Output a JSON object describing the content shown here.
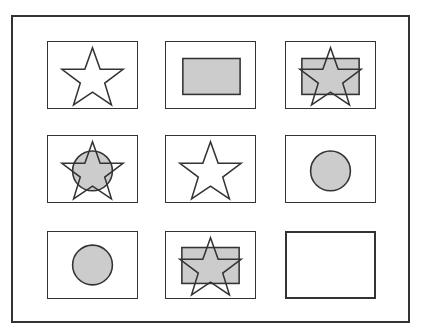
{
  "puzzle": {
    "type": "3x3 matrix reasoning",
    "colors": {
      "stroke": "#333333",
      "fill": "#cccccc",
      "background": "#ffffff"
    },
    "cells": [
      {
        "row": 1,
        "col": 1,
        "shapes": [
          "star-outline"
        ]
      },
      {
        "row": 1,
        "col": 2,
        "shapes": [
          "rectangle-filled"
        ]
      },
      {
        "row": 1,
        "col": 3,
        "shapes": [
          "rectangle-filled",
          "star-outline"
        ]
      },
      {
        "row": 2,
        "col": 1,
        "shapes": [
          "circle-filled",
          "star-outline"
        ]
      },
      {
        "row": 2,
        "col": 2,
        "shapes": [
          "star-outline"
        ]
      },
      {
        "row": 2,
        "col": 3,
        "shapes": [
          "circle-filled"
        ]
      },
      {
        "row": 3,
        "col": 1,
        "shapes": [
          "circle-filled"
        ]
      },
      {
        "row": 3,
        "col": 2,
        "shapes": [
          "rectangle-filled",
          "star-outline"
        ]
      },
      {
        "row": 3,
        "col": 3,
        "shapes": [],
        "empty": true
      }
    ]
  }
}
